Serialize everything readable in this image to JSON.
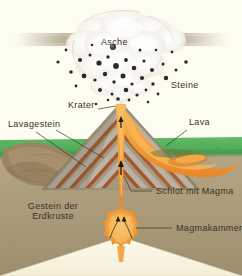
{
  "diagram": {
    "background_color": "#fdfcf0",
    "labels": {
      "asche": "Asche",
      "steine": "Steine",
      "krater": "Krater",
      "lava": "Lava",
      "lavagestein": "Lavagestein",
      "schlot": "Schlot mit Magma",
      "gestein_line1": "Gestein der",
      "gestein_line2": "Erdkruste",
      "magmakammer": "Magmakammer"
    },
    "colors": {
      "background": "#fdfcf0",
      "ash_cloud": "#f2f0ea",
      "ash_plume_haze": "#b4a88c",
      "rocks": "#2b2a25",
      "grass": "#54b25c",
      "crust_rock": "#a99a7c",
      "magma": "#f2a03c",
      "magma_core": "#f7b95a",
      "lava_flow": "#ef8a2a",
      "strata_gray": "#b8b2a6",
      "strata_brown": "#a4552a",
      "cone_body": "#9a8e76",
      "old_flow": "#9a8560",
      "leader_line": "#3a3226",
      "deep_wedge": "#fbf6e6"
    },
    "features": [
      {
        "name": "ash-cloud",
        "label": "Asche"
      },
      {
        "name": "ejected-rocks",
        "label": "Steine"
      },
      {
        "name": "crater",
        "label": "Krater"
      },
      {
        "name": "lava-flow",
        "label": "Lava"
      },
      {
        "name": "lava-rock-layer",
        "label": "Lavagestein"
      },
      {
        "name": "volcanic-conduit",
        "label": "Schlot mit Magma"
      },
      {
        "name": "earth-crust-rock",
        "label": "Gestein der Erdkruste"
      },
      {
        "name": "magma-chamber",
        "label": "Magmakammer"
      }
    ]
  }
}
